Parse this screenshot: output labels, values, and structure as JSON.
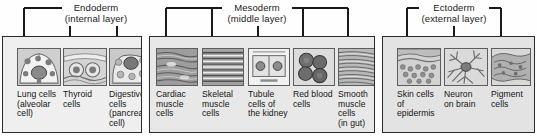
{
  "figure": {
    "background_color": "#ffffff",
    "line_color": "#1a1a1a"
  },
  "germ_layers": [
    {
      "key": "endoderm",
      "name": "Endoderm",
      "sublabel": "(internal layer)",
      "panel_fill": "#efefef",
      "bracket": {
        "left": 24,
        "right": 117,
        "top_y": 8,
        "arrow_tip_y": 45
      },
      "panel": {
        "x": 2,
        "y": 36,
        "width": 140,
        "height": 97
      },
      "arrow_x": [
        24,
        70,
        117
      ],
      "cells": [
        {
          "icon": "lung-alveolar-cell-micrograph",
          "caption_lines": [
            "Lung cells",
            "(alveolar",
            "cell)"
          ]
        },
        {
          "icon": "thyroid-cell-micrograph",
          "caption_lines": [
            "Thyroid",
            "cells"
          ]
        },
        {
          "icon": "digestive-pancreatic-cell-micrograph",
          "caption_lines": [
            "Digestive",
            "cells",
            "(pancreatic",
            "cell)"
          ]
        }
      ]
    },
    {
      "key": "mesoderm",
      "name": "Mesoderm",
      "sublabel": "(middle layer)",
      "panel_fill": "#e8e8e8",
      "bracket": {
        "left": 166,
        "right": 348,
        "top_y": 8,
        "arrow_tip_y": 45
      },
      "panel": {
        "x": 149,
        "y": 36,
        "width": 226,
        "height": 97
      },
      "arrow_x": [
        166,
        212,
        258,
        303,
        348
      ],
      "cells": [
        {
          "icon": "cardiac-muscle-micrograph",
          "caption_lines": [
            "Cardiac",
            "muscle",
            "cells"
          ]
        },
        {
          "icon": "skeletal-muscle-micrograph",
          "caption_lines": [
            "Skeletal",
            "muscle",
            "cells"
          ]
        },
        {
          "icon": "kidney-tubule-cell-micrograph",
          "caption_lines": [
            "Tubule",
            "cells of",
            "the kidney"
          ]
        },
        {
          "icon": "red-blood-cell-micrograph",
          "caption_lines": [
            "Red blood",
            "cells"
          ]
        },
        {
          "icon": "smooth-muscle-micrograph",
          "caption_lines": [
            "Smooth",
            "muscle",
            "cells",
            "(in gut)"
          ]
        }
      ]
    },
    {
      "key": "ectoderm",
      "name": "Ectoderm",
      "sublabel": "(external layer)",
      "panel_fill": "#e3e3e3",
      "bracket": {
        "left": 407,
        "right": 501,
        "top_y": 8,
        "arrow_tip_y": 45
      },
      "panel": {
        "x": 382,
        "y": 36,
        "width": 153,
        "height": 97
      },
      "arrow_x": [
        407,
        454,
        501
      ],
      "cells": [
        {
          "icon": "skin-epidermis-micrograph",
          "caption_lines": [
            "Skin cells",
            "of",
            "epidermis"
          ]
        },
        {
          "icon": "neuron-brain-micrograph",
          "caption_lines": [
            "Neuron",
            "on brain"
          ]
        },
        {
          "icon": "pigment-cell-micrograph",
          "caption_lines": [
            "Pigment",
            "cells"
          ]
        }
      ]
    }
  ]
}
